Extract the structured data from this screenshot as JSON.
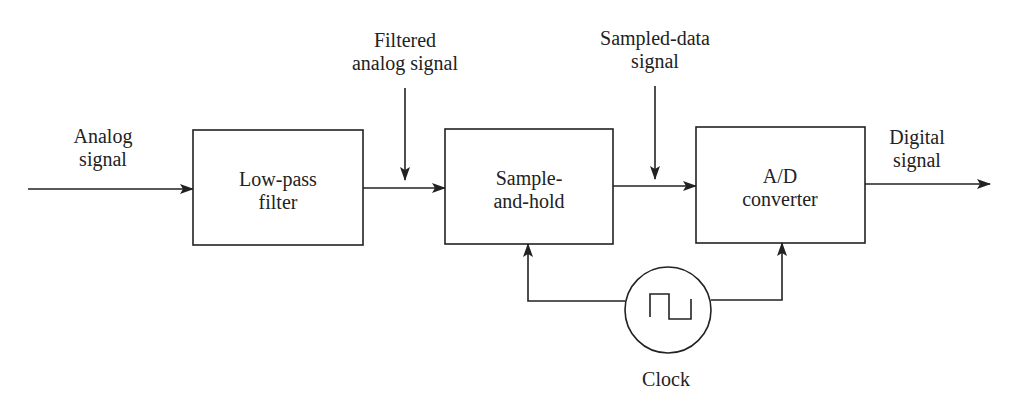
{
  "diagram": {
    "type": "block-diagram",
    "colors": {
      "stroke": "#222222",
      "background": "#ffffff"
    },
    "blocks": [
      {
        "id": "lowpass",
        "lines": [
          "Low-pass",
          "filter"
        ]
      },
      {
        "id": "samplehold",
        "lines": [
          "Sample-",
          "and-hold"
        ]
      },
      {
        "id": "adc",
        "lines": [
          "A/D",
          "converter"
        ]
      }
    ],
    "signals": {
      "input": [
        "Analog",
        "signal"
      ],
      "filtered": [
        "Filtered",
        "analog signal"
      ],
      "sampled": [
        "Sampled-data",
        "signal"
      ],
      "output": [
        "Digital",
        "signal"
      ]
    },
    "clock": {
      "label": "Clock",
      "icon": "square-wave-icon"
    },
    "edges": [
      {
        "from": "input",
        "to": "lowpass"
      },
      {
        "from": "lowpass",
        "to": "samplehold"
      },
      {
        "from": "samplehold",
        "to": "adc"
      },
      {
        "from": "adc",
        "to": "output"
      },
      {
        "from": "clock",
        "to": "samplehold"
      },
      {
        "from": "clock",
        "to": "adc"
      }
    ]
  }
}
